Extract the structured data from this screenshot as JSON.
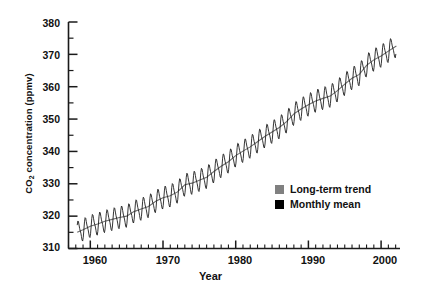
{
  "chart_data": {
    "type": "line",
    "title": "",
    "xlabel": "Year",
    "ylabel": "CO2 concentration (ppmv)",
    "ylabel_parts": {
      "prefix": "CO",
      "sub": "2",
      "suffix": " concentration (ppmv)"
    },
    "xlim": [
      1957.0,
      2002.6
    ],
    "ylim": [
      310,
      380
    ],
    "grid": false,
    "legend_position": "inside-lower-right",
    "ytick_labels": [
      "380",
      "370",
      "360",
      "350",
      "340",
      "330",
      "320",
      "310"
    ],
    "ytick_values": [
      380,
      370,
      360,
      350,
      340,
      330,
      320,
      310
    ],
    "yminor_interval": 5,
    "xtick_labels": [
      "1960",
      "1970",
      "1980",
      "1990",
      "2000"
    ],
    "xtick_values": [
      1960,
      1970,
      1980,
      1990,
      2000
    ],
    "xminor_interval": 1,
    "legend": [
      {
        "label": "Long-term trend",
        "color": "#808080"
      },
      {
        "label": "Monthly mean",
        "color": "#000000"
      }
    ],
    "series": [
      {
        "name": "Long-term trend",
        "color": "#808080",
        "x": [
          1958.2,
          1959,
          1960,
          1961,
          1962,
          1963,
          1964,
          1965,
          1966,
          1967,
          1968,
          1969,
          1970,
          1971,
          1972,
          1973,
          1974,
          1975,
          1976,
          1977,
          1978,
          1979,
          1980,
          1981,
          1982,
          1983,
          1984,
          1985,
          1986,
          1987,
          1988,
          1989,
          1990,
          1991,
          1992,
          1993,
          1994,
          1995,
          1996,
          1997,
          1998,
          1999,
          2000,
          2001,
          2002.1
        ],
        "values": [
          315.0,
          315.8,
          316.9,
          317.6,
          318.4,
          319.0,
          319.6,
          320.0,
          321.4,
          322.2,
          323.0,
          324.6,
          325.7,
          326.3,
          327.5,
          329.7,
          330.2,
          331.1,
          332.0,
          333.8,
          335.4,
          336.8,
          338.7,
          340.1,
          341.4,
          343.0,
          344.6,
          346.0,
          347.4,
          349.2,
          351.6,
          353.1,
          354.4,
          355.6,
          356.4,
          357.1,
          358.8,
          360.8,
          362.6,
          363.8,
          366.6,
          368.3,
          369.5,
          371.0,
          372.6
        ]
      },
      {
        "name": "Monthly mean",
        "color": "#000000",
        "description": "Monthly mean CO2 with seasonal sawtooth oscillation of roughly +/- 3 ppmv superimposed on the long-term trend",
        "seasonal_amplitude": 3.1
      }
    ]
  }
}
